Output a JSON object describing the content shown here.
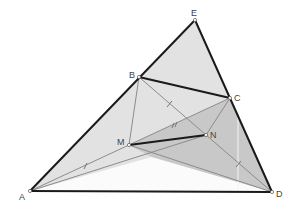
{
  "figure": {
    "type": "geometry-construction",
    "points": {
      "A": {
        "label": "A",
        "x": 30,
        "y": 191
      },
      "B": {
        "label": "B",
        "x": 139,
        "y": 77
      },
      "C": {
        "label": "C",
        "x": 230,
        "y": 98
      },
      "D": {
        "label": "D",
        "x": 272,
        "y": 192
      },
      "E": {
        "label": "E",
        "x": 195,
        "y": 20
      },
      "M": {
        "label": "M",
        "x": 129,
        "y": 145
      },
      "N": {
        "label": "N",
        "x": 206,
        "y": 135
      }
    },
    "thick_segments": [
      "AE",
      "ED",
      "AD",
      "BC",
      "MN"
    ],
    "thin_segments": [
      "BD",
      "AC",
      "BM",
      "CN",
      "AN",
      "MD"
    ],
    "tick_marks": [
      "BN",
      "MC",
      "AM",
      "ND"
    ],
    "shaded_regions": [
      {
        "name": "outer-light",
        "polygon": "A-E-D",
        "color": "#e4e4e4"
      },
      {
        "name": "inner-dark",
        "polygon": "M-C-D",
        "color": "#c9c9c9"
      },
      {
        "name": "lower-white",
        "polygon": "A-X-D",
        "color": "#ffffff"
      }
    ],
    "colors": {
      "thick_line": "#1a1a1a",
      "thin_line": "#8a8a8a",
      "label": "#444444"
    }
  }
}
